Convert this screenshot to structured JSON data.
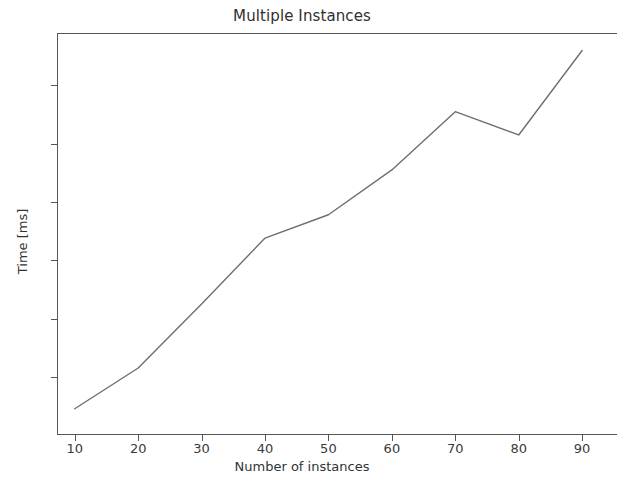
{
  "figure": {
    "title": "Multiple Instances",
    "background_color": "#ffffff",
    "axis_color": "#555555",
    "line_color": "#6e6e6e"
  },
  "axes": {
    "xlabel": "Number of instances",
    "ylabel": "Time [ms]",
    "x_ticks": [
      "10",
      "20",
      "30",
      "40",
      "50",
      "60",
      "70",
      "80",
      "90"
    ],
    "y_ticks": [
      "6",
      "7",
      "8",
      "9",
      "10",
      "11"
    ]
  },
  "chart_data": {
    "type": "line",
    "title": "Multiple Instances",
    "xlabel": "Number of instances",
    "ylabel": "Time [ms]",
    "x": [
      10,
      20,
      30,
      40,
      50,
      60,
      70,
      80,
      90
    ],
    "values": [
      5.45,
      6.15,
      7.25,
      8.38,
      8.78,
      9.55,
      10.55,
      10.15,
      11.6
    ],
    "series": [
      {
        "name": "Time [ms]",
        "values": [
          5.45,
          6.15,
          7.25,
          8.38,
          8.78,
          9.55,
          10.55,
          10.15,
          11.6
        ]
      }
    ],
    "xlim": [
      7.2,
      95.5
    ],
    "ylim": [
      5.0,
      11.9
    ],
    "x_tick_values": [
      10,
      20,
      30,
      40,
      50,
      60,
      70,
      80,
      90
    ],
    "y_tick_values": [
      6,
      7,
      8,
      9,
      10,
      11
    ],
    "grid": false,
    "legend": false,
    "markers": false,
    "line_color": "#6e6e6e",
    "line_width": 1.4
  }
}
